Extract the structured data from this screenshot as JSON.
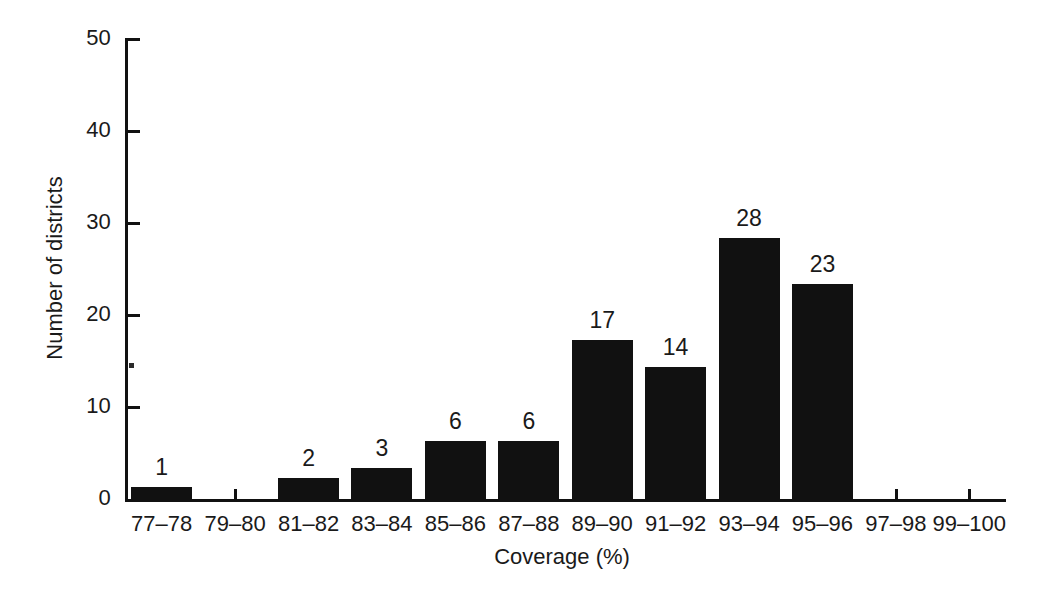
{
  "chart_data": {
    "type": "bar",
    "title": "",
    "subtitle": "",
    "xlabel": "Coverage (%)",
    "ylabel": "Number of districts",
    "categories": [
      "77–78",
      "79–80",
      "81–82",
      "83–84",
      "85–86",
      "87–88",
      "89–90",
      "91–92",
      "93–94",
      "95–96",
      "97–98",
      "99–100"
    ],
    "values": [
      1,
      0,
      2,
      3,
      6,
      6,
      17,
      14,
      28,
      23,
      0,
      0
    ],
    "bar_labels": [
      "1",
      "",
      "2",
      "3",
      "6",
      "6",
      "17",
      "14",
      "28",
      "23",
      "",
      ""
    ],
    "ylim": [
      0,
      50
    ],
    "yticks": [
      0,
      10,
      20,
      30,
      40,
      50
    ],
    "ytick_labels": [
      "0",
      "10",
      "20",
      "30",
      "40",
      "50"
    ],
    "grid": false,
    "legend": null,
    "bar_color": "#111111",
    "background_color": "#ffffff",
    "axis_color": "#111111",
    "annotations": []
  }
}
